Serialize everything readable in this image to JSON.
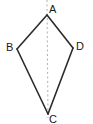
{
  "figure": {
    "name": "kite-abcd",
    "background_color": "#ffffff",
    "stroke_color": "#2b2b2b",
    "stroke_width": 1.6,
    "axis_color": "#b0b0b0",
    "axis_dash": "2,2.5",
    "axis_width": 1,
    "canvas": {
      "width": 93,
      "height": 124
    },
    "vertices": [
      {
        "id": "A",
        "label": "A",
        "x": 47,
        "y": 15
      },
      {
        "id": "B",
        "label": "B",
        "x": 17,
        "y": 49
      },
      {
        "id": "C",
        "label": "C",
        "x": 48,
        "y": 114
      },
      {
        "id": "D",
        "label": "D",
        "x": 73,
        "y": 48
      }
    ],
    "edges": [
      {
        "id": "AB",
        "from": "A",
        "to": "B"
      },
      {
        "id": "BC",
        "from": "B",
        "to": "C"
      },
      {
        "id": "CD",
        "from": "C",
        "to": "D"
      },
      {
        "id": "DA",
        "from": "D",
        "to": "A"
      }
    ],
    "polygon_points": "47,15 17,49 48,114 73,48",
    "axis_of_symmetry": {
      "x1": 47,
      "y1": 0,
      "x2": 48,
      "y2": 118
    },
    "labels": {
      "A": "A",
      "B": "B",
      "C": "C",
      "D": "D"
    }
  }
}
